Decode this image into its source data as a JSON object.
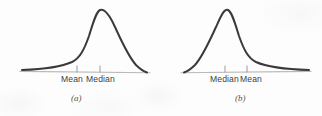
{
  "figure": {
    "background_color": "#fdfdfd",
    "curve_color": "#3a3a3a",
    "axis_color": "#b9b9b9",
    "tick_color": "#9a9a9a",
    "label_color": "#3d3d3d",
    "caption_color": "#555555"
  },
  "panels": [
    {
      "id": "a",
      "caption": "(a)",
      "skew": "left-skewed",
      "labels": [
        {
          "text": "Mean",
          "tick_x": 77
        },
        {
          "text": "Median",
          "tick_x": 100
        }
      ]
    },
    {
      "id": "b",
      "caption": "(b)",
      "skew": "right-skewed",
      "labels": [
        {
          "text": "Median",
          "tick_x": 64
        },
        {
          "text": "Mean",
          "tick_x": 86
        }
      ]
    }
  ],
  "chart_data": {
    "type": "line",
    "title": "",
    "xlabel": "",
    "ylabel": "",
    "grid": false,
    "legend": "none",
    "charts": [
      {
        "id": "a",
        "caption": "(a)",
        "skew": "negatively skewed (left-skewed)",
        "axis_range_px": [
          22,
          148
        ],
        "baseline_y_px": 72,
        "peak_x_px": 98,
        "peak_y_px": 10,
        "annotations": [
          {
            "label": "Mean",
            "x_px": 77
          },
          {
            "label": "Median",
            "x_px": 100
          }
        ],
        "path": "M 22 70 C 44 69.2, 60 67.5, 72 62 C 80 58, 84 50, 89 36 C 93 23, 96 12, 100 10 C 105 8.5, 110 16, 115 27 C 121 40, 128 56, 136 65 C 140 69, 144 71.5, 147 72.5",
        "baseline_path": "M 20 71.4 L 150 72.8"
      },
      {
        "id": "b",
        "caption": "(b)",
        "skew": "positively skewed (right-skewed)",
        "axis_range_px": [
          22,
          150
        ],
        "baseline_y_px": 72,
        "peak_x_px": 66,
        "peak_y_px": 10,
        "annotations": [
          {
            "label": "Median",
            "x_px": 64
          },
          {
            "label": "Mean",
            "x_px": 86
          }
        ],
        "path": "M 23 72.5 C 26 71.5, 30 69, 34 65 C 42 56, 49 40, 55 27 C 60 16, 63 8.5, 67 10 C 71 12, 74 23, 78 36 C 83 50, 87 58, 95 62 C 107 67.5, 123 69.2, 148 70",
        "baseline_path": "M 20 72.8 L 150 71.4"
      }
    ]
  }
}
